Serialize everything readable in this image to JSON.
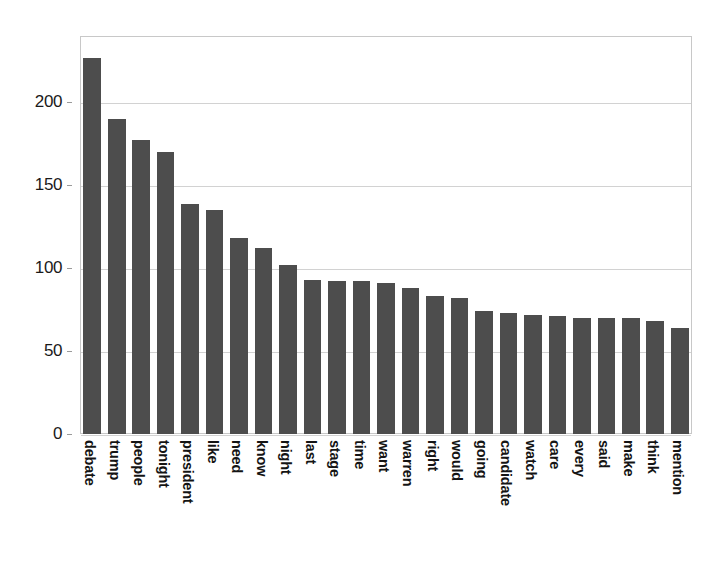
{
  "chart_data": {
    "type": "bar",
    "title": "",
    "subtitle": "",
    "xlabel": "",
    "ylabel": "",
    "ylim": [
      0,
      240
    ],
    "yticks": [
      0,
      50,
      100,
      150,
      200
    ],
    "ytick_labels": [
      "0",
      "50",
      "100",
      "150",
      "200"
    ],
    "grid": true,
    "legend": false,
    "orientation": "vertical",
    "bar_color": "#4d4d4d",
    "categories": [
      "debate",
      "trump",
      "people",
      "tonight",
      "president",
      "like",
      "need",
      "know",
      "night",
      "last",
      "stage",
      "time",
      "want",
      "warren",
      "right",
      "would",
      "going",
      "candidate",
      "watch",
      "care",
      "every",
      "said",
      "make",
      "think",
      "mention"
    ],
    "values": [
      227,
      190,
      177,
      170,
      139,
      135,
      118,
      112,
      102,
      93,
      92,
      92,
      91,
      88,
      83,
      82,
      74,
      73,
      72,
      71,
      70,
      70,
      70,
      68,
      64
    ]
  },
  "figure": {
    "background": "#ffffff",
    "axes_border_color": "#c8c8c8",
    "gridline_color": "#d2d2d2"
  }
}
